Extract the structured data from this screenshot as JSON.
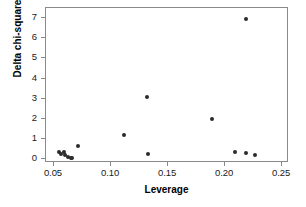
{
  "chart_data": {
    "type": "scatter",
    "title": "",
    "xlabel": "Leverage",
    "ylabel": "Delta chi-square",
    "xlim": [
      0.043,
      0.256
    ],
    "ylim": [
      -0.18,
      7.5
    ],
    "grid": false,
    "legend": null,
    "xticks": [
      0.05,
      0.1,
      0.15,
      0.2,
      0.25
    ],
    "xticklabels": [
      "0.05",
      "0.10",
      "0.15",
      "0.20",
      "0.25"
    ],
    "yticks": [
      0,
      1,
      2,
      3,
      4,
      5,
      6,
      7
    ],
    "yticklabels": [
      "0",
      "1",
      "2",
      "3",
      "4",
      "5",
      "6",
      "7"
    ],
    "marker": "filled-circle",
    "marker_color": "#2b2b2b",
    "points": [
      {
        "x": 0.0545,
        "y": 0.36
      },
      {
        "x": 0.0565,
        "y": 0.29
      },
      {
        "x": 0.0585,
        "y": 0.38
      },
      {
        "x": 0.06,
        "y": 0.22
      },
      {
        "x": 0.0625,
        "y": 0.11
      },
      {
        "x": 0.0645,
        "y": 0.06
      },
      {
        "x": 0.066,
        "y": 0.05
      },
      {
        "x": 0.071,
        "y": 0.67
      },
      {
        "x": 0.111,
        "y": 1.2
      },
      {
        "x": 0.1315,
        "y": 3.08
      },
      {
        "x": 0.132,
        "y": 0.27
      },
      {
        "x": 0.1885,
        "y": 2.0
      },
      {
        "x": 0.2085,
        "y": 0.38
      },
      {
        "x": 0.218,
        "y": 0.33
      },
      {
        "x": 0.218,
        "y": 6.97
      },
      {
        "x": 0.226,
        "y": 0.2
      }
    ]
  },
  "figure": {
    "background_color": "#ffffff",
    "axis_color": "#8a8a8a",
    "text_color": "#000000"
  }
}
